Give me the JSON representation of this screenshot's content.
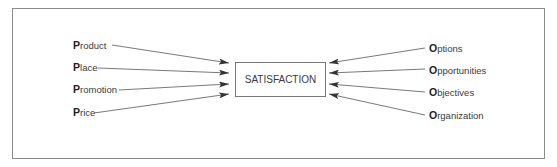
{
  "diagram": {
    "center": {
      "label": "SATISFACTION"
    },
    "left_factors": [
      {
        "initial": "P",
        "rest": "roduct"
      },
      {
        "initial": "P",
        "rest": "lace"
      },
      {
        "initial": "P",
        "rest": "romotion"
      },
      {
        "initial": "P",
        "rest": "rice"
      }
    ],
    "right_factors": [
      {
        "initial": "O",
        "rest": "ptions"
      },
      {
        "initial": "O",
        "rest": "pportunities"
      },
      {
        "initial": "O",
        "rest": "bjectives"
      },
      {
        "initial": "O",
        "rest": "rganization"
      }
    ],
    "colors": {
      "line": "#555555",
      "frame": "#8a8a8a",
      "text": "#3a3a3a"
    }
  }
}
